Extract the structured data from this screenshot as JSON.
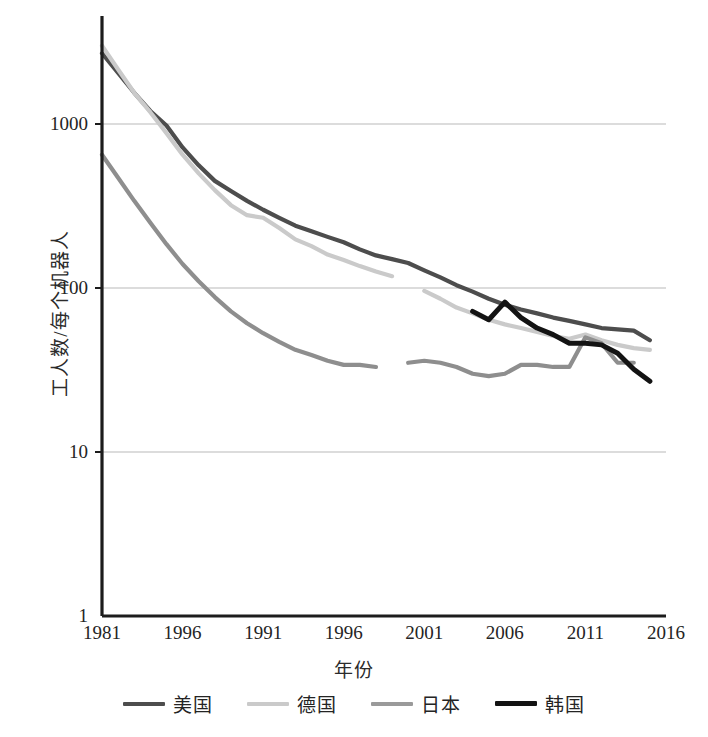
{
  "chart_data": {
    "type": "line",
    "title": "",
    "xlabel": "年份",
    "ylabel": "工人数/每个机器人",
    "yscale": "log",
    "ylim": [
      1,
      3000
    ],
    "xlim": [
      1981,
      2016
    ],
    "grid": true,
    "legend_position": "bottom",
    "y_ticks": [
      {
        "value": 1000,
        "label": "1000"
      },
      {
        "value": 100,
        "label": "100"
      },
      {
        "value": 10,
        "label": "10"
      },
      {
        "value": 1,
        "label": "1"
      }
    ],
    "x_ticks": [
      {
        "value": 1981,
        "label": "1981"
      },
      {
        "value": 1986,
        "label": "1996"
      },
      {
        "value": 1991,
        "label": "1991"
      },
      {
        "value": 1996,
        "label": "1996"
      },
      {
        "value": 2001,
        "label": "2001"
      },
      {
        "value": 2006,
        "label": "2006"
      },
      {
        "value": 2011,
        "label": "2011"
      },
      {
        "value": 2016,
        "label": "2016"
      }
    ],
    "series": [
      {
        "name": "美国",
        "color": "#4d4d4d",
        "width": 4.2,
        "x": [
          1981,
          1982,
          1983,
          1984,
          1985,
          1986,
          1987,
          1988,
          1989,
          1990,
          1991,
          1992,
          1993,
          1994,
          1995,
          1996,
          1997,
          1998,
          1999,
          2000,
          2001,
          2002,
          2003,
          2004,
          2005,
          2006,
          2007,
          2008,
          2009,
          2010,
          2011,
          2012,
          2013,
          2014,
          2015
        ],
        "y": [
          2700,
          2050,
          1550,
          1200,
          980,
          720,
          560,
          450,
          390,
          340,
          300,
          268,
          240,
          222,
          205,
          190,
          172,
          158,
          150,
          142,
          128,
          116,
          104,
          95,
          86,
          79,
          74,
          70,
          66,
          63,
          60,
          57,
          56,
          55,
          48
        ]
      },
      {
        "name": "德国",
        "color": "#cacaca",
        "width": 4.2,
        "x": [
          1981,
          1982,
          1983,
          1984,
          1985,
          1986,
          1987,
          1988,
          1989,
          1990,
          1991,
          1992,
          1993,
          1994,
          1995,
          1996,
          1997,
          1998,
          1999,
          null,
          2001,
          2002,
          2003,
          2004,
          2005,
          2006,
          2007,
          2008,
          2009,
          2010,
          2011,
          2012,
          2013,
          2014,
          2015
        ],
        "y": [
          3000,
          2150,
          1550,
          1180,
          880,
          650,
          500,
          395,
          320,
          278,
          268,
          232,
          198,
          180,
          160,
          148,
          136,
          126,
          118,
          null,
          96,
          86,
          76,
          70,
          64,
          60,
          57,
          54,
          51,
          49,
          52,
          48,
          45,
          43,
          42
        ]
      },
      {
        "name": "日本",
        "color": "#8e8e8e",
        "width": 4.2,
        "x": [
          1981,
          1982,
          1983,
          1984,
          1985,
          1986,
          1987,
          1988,
          1989,
          1990,
          1991,
          1992,
          1993,
          1994,
          1995,
          1996,
          1997,
          1998,
          null,
          2000,
          2001,
          2002,
          2003,
          2004,
          2005,
          2006,
          2007,
          2008,
          2009,
          2010,
          2011,
          2012,
          2013,
          2014
        ],
        "y": [
          650,
          470,
          340,
          250,
          185,
          140,
          110,
          88,
          72,
          61,
          53,
          47,
          42,
          39,
          36,
          34,
          34,
          33,
          null,
          35,
          36,
          35,
          33,
          30,
          29,
          30,
          34,
          34,
          33,
          33,
          50,
          46,
          35,
          35
        ]
      },
      {
        "name": "韩国",
        "color": "#131313",
        "width": 5.0,
        "x": [
          2004,
          2005,
          2006,
          2007,
          2008,
          2009,
          2010,
          2011,
          2012,
          2013,
          2014,
          2015
        ],
        "y": [
          72,
          64,
          82,
          66,
          57,
          52,
          46,
          46,
          45,
          40,
          32,
          27
        ]
      }
    ]
  },
  "legend": {
    "items": [
      {
        "label": "美国",
        "color": "#4d4d4d"
      },
      {
        "label": "德国",
        "color": "#cacaca"
      },
      {
        "label": "日本",
        "color": "#9a9a9a"
      },
      {
        "label": "韩国",
        "color": "#131313"
      }
    ]
  },
  "axis_colors": {
    "spine": "#1c1c1c",
    "grid": "#b9b9b9",
    "text": "#242424"
  }
}
